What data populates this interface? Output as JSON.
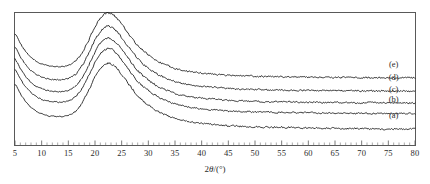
{
  "figure": {
    "title": "",
    "background_color": "#ffffff",
    "frame_color": "#595959",
    "curve_color": "#131313"
  },
  "axis": {
    "x_title_prefix": "2",
    "x_title_symbol": "θ",
    "x_title_suffix": "/(°)",
    "x_title_full": "2θ/(°)",
    "y_title": "",
    "x_ticks": [
      5,
      10,
      15,
      20,
      25,
      30,
      35,
      40,
      45,
      50,
      55,
      60,
      65,
      70,
      75,
      80
    ],
    "x_tick_labels": [
      "5",
      "10",
      "15",
      "20",
      "25",
      "30",
      "35",
      "40",
      "45",
      "50",
      "55",
      "60",
      "65",
      "70",
      "75",
      "80"
    ],
    "x_min": 5,
    "x_max": 80,
    "x_minor_step": 1,
    "y_ticks_visible": false,
    "grid": false
  },
  "curve_labels": [
    {
      "id": "e",
      "text": "(e)",
      "x": 76.0,
      "y_offset_px": -11
    },
    {
      "id": "d",
      "text": "(d)",
      "x": 76.0,
      "y_offset_px": -11
    },
    {
      "id": "c",
      "text": "(c)",
      "x": 76.0,
      "y_offset_px": -11
    },
    {
      "id": "b",
      "text": "(b)",
      "x": 76.0,
      "y_offset_px": -11
    },
    {
      "id": "a",
      "text": "(a)",
      "x": 76.0,
      "y_offset_px": -11
    }
  ],
  "chart_data": {
    "type": "line",
    "title": "",
    "subtitle": "",
    "xlabel": "2θ/(°)",
    "ylabel": "Intensity (a.u.)",
    "xlim": [
      5,
      80
    ],
    "ylim": [
      0,
      100
    ],
    "grid": false,
    "legend_position": "right-inline",
    "legend_entries": [
      "(a)",
      "(b)",
      "(c)",
      "(d)",
      "(e)"
    ],
    "annotations": [
      "Broad amorphous halo centred near 2θ = 22°",
      "Low-angle upturn below 2θ = 10°",
      "Shallow valley near 2θ = 13–14°",
      "Flat featureless tail beyond 2θ = 40°",
      "Curves are vertically offset for clarity"
    ],
    "x": [
      5,
      6,
      7,
      8,
      9,
      10,
      11,
      12,
      13,
      14,
      15,
      16,
      17,
      18,
      19,
      20,
      21,
      22,
      23,
      24,
      25,
      26,
      27,
      28,
      29,
      30,
      32,
      34,
      36,
      38,
      40,
      45,
      50,
      55,
      60,
      65,
      70,
      75,
      80
    ],
    "series": [
      {
        "name": "(a)",
        "label": "(a)",
        "baseline_offset": 0,
        "values": [
          46,
          39,
          33,
          28.5,
          25.5,
          23.5,
          22.3,
          21.7,
          21.5,
          21.6,
          22.4,
          24.5,
          28.5,
          35,
          43,
          51.5,
          58,
          61.5,
          61.5,
          58.5,
          53.5,
          48,
          42.5,
          37.5,
          33.5,
          30,
          25,
          21.5,
          19,
          17.5,
          16.3,
          14.6,
          13.8,
          13.3,
          12.9,
          12.6,
          12.3,
          12.1,
          12.0
        ]
      },
      {
        "name": "(b)",
        "label": "(b)",
        "baseline_offset": 16,
        "values": [
          57,
          50,
          44,
          39.5,
          36.5,
          34.5,
          33.3,
          32.7,
          32.5,
          32.6,
          33.4,
          35.5,
          39.5,
          46,
          54,
          62.5,
          69,
          72.5,
          72.5,
          69.5,
          64.5,
          59,
          53.5,
          48.5,
          44.5,
          41,
          36,
          32.5,
          30,
          28.5,
          27.4,
          25.8,
          25.1,
          24.7,
          24.4,
          24.2,
          24.0,
          23.9,
          23.8
        ]
      },
      {
        "name": "(c)",
        "label": "(c)",
        "baseline_offset": 26,
        "values": [
          65,
          58,
          52,
          47.5,
          44.5,
          42.5,
          41.3,
          40.7,
          40.5,
          40.6,
          41.4,
          43.5,
          47.5,
          54,
          62,
          70.5,
          77,
          80.5,
          80.5,
          77.5,
          72.5,
          67,
          61.5,
          56.5,
          52.5,
          49,
          44,
          40.5,
          38,
          36.5,
          35.4,
          33.8,
          33.1,
          32.7,
          32.4,
          32.2,
          32.0,
          31.9,
          31.8
        ]
      },
      {
        "name": "(d)",
        "label": "(d)",
        "baseline_offset": 36,
        "values": [
          74,
          67,
          61,
          56.5,
          53.5,
          51.5,
          50.3,
          49.7,
          49.5,
          49.6,
          50.4,
          52.5,
          56.5,
          63,
          71,
          79.5,
          86,
          89.5,
          89.5,
          86.5,
          81.5,
          76,
          70.5,
          65.5,
          61.5,
          58,
          53,
          49.5,
          47,
          45.5,
          44.4,
          42.8,
          42.1,
          41.7,
          41.4,
          41.2,
          41.0,
          40.9,
          40.8
        ]
      },
      {
        "name": "(e)",
        "label": "(e)",
        "baseline_offset": 47,
        "values": [
          84,
          77,
          71,
          66.5,
          63.5,
          61.5,
          60.3,
          59.7,
          59.5,
          59.6,
          60.4,
          62.5,
          66.5,
          73,
          81,
          89.5,
          96,
          99.5,
          99.5,
          96.5,
          91.5,
          86,
          80.5,
          75.5,
          71.5,
          68,
          63,
          59.5,
          57,
          55.5,
          54.4,
          52.8,
          52.1,
          51.7,
          51.4,
          51.2,
          51.0,
          50.9,
          50.8
        ]
      }
    ],
    "peak_positions_deg": [
      22.4,
      22.4,
      22.4,
      22.4,
      22.4
    ],
    "peak_description": "single broad halo, FWHM approximately 9 degrees"
  }
}
